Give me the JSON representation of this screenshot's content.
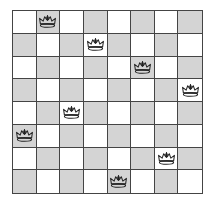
{
  "board": {
    "size": 8,
    "colors": {
      "light": "#ffffff",
      "dark": "#d4d4d4",
      "grid": "#444444",
      "piece_outline": "#222222"
    },
    "dark_square_rule": "row+col odd",
    "piece_icon": "crown-icon",
    "queens": [
      {
        "row": 0,
        "col": 1
      },
      {
        "row": 1,
        "col": 3
      },
      {
        "row": 2,
        "col": 5
      },
      {
        "row": 3,
        "col": 7
      },
      {
        "row": 4,
        "col": 2
      },
      {
        "row": 5,
        "col": 0
      },
      {
        "row": 6,
        "col": 6
      },
      {
        "row": 7,
        "col": 4
      }
    ]
  }
}
